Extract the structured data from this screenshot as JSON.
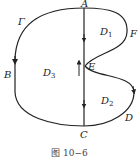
{
  "figure": {
    "caption": "图 10−6",
    "curve_name": "Γ",
    "points": {
      "A": "A",
      "B": "B",
      "C": "C",
      "D": "D",
      "E": "E",
      "F": "F"
    },
    "regions": {
      "D1": {
        "main": "D",
        "sub": "1"
      },
      "D2": {
        "main": "D",
        "sub": "2"
      },
      "D3": {
        "main": "D",
        "sub": "3"
      }
    },
    "colors": {
      "stroke": "#222222",
      "text": "#222222"
    }
  }
}
